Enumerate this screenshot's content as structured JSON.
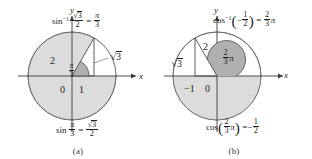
{
  "figure": {
    "background": "#ffffff",
    "ink": "#231f20",
    "shade": "#d9d9d9",
    "wedge_shade": "#b3b3b3",
    "panels": [
      {
        "id": "a",
        "caption": "(a)",
        "top_equation": {
          "text": "sin^-1 (sqrt(3)/2) = pi/3",
          "function": "sin",
          "superscript": "−1",
          "argument_numerator": "3",
          "argument_denominator": "2",
          "equals": "=",
          "result_numerator": "π",
          "result_denominator": "3"
        },
        "bottom_equation": {
          "text": "sin(pi/3) = sqrt(3)/2",
          "function": "sin",
          "angle_numerator": "π",
          "angle_denominator": "3",
          "equals": "=",
          "result_numerator": "3",
          "result_denominator": "2"
        },
        "axis_x_label": "x",
        "axis_y_label": "y",
        "origin_label": "0",
        "x_tick_label": "1",
        "hypotenuse_label": "2",
        "angle_label_numerator": "π",
        "angle_label_denominator": "3",
        "opposite_side_label": "3",
        "opposite_side_radical": "√"
      },
      {
        "id": "b",
        "caption": "(b)",
        "top_equation": {
          "text": "cos^-1 (-1/2) = (2/3) pi",
          "function": "cos",
          "superscript": "−1",
          "argument_sign": "−",
          "argument_numerator": "1",
          "argument_denominator": "2",
          "equals": "=",
          "result_numerator": "2",
          "result_denominator": "3",
          "result_symbol": "π"
        },
        "bottom_equation": {
          "text": "cos((2/3) pi) = -1/2",
          "function": "cos",
          "angle_numerator": "2",
          "angle_denominator": "3",
          "angle_symbol": "π",
          "equals": "=",
          "result_sign": "−",
          "result_numerator": "1",
          "result_denominator": "2"
        },
        "axis_x_label": "x",
        "axis_y_label": "y",
        "origin_label": "0",
        "x_tick_label": "−1",
        "hypotenuse_label": "2",
        "angle_label_numerator": "2",
        "angle_label_denominator": "3",
        "angle_label_symbol": "π",
        "adjacent_side_label": "3",
        "adjacent_side_radical": "√"
      }
    ]
  }
}
